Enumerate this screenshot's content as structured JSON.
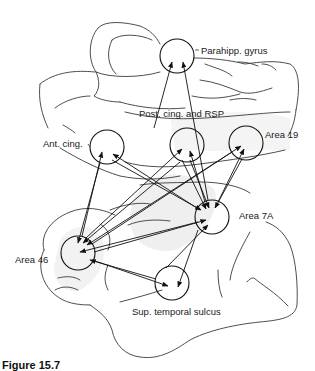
{
  "figure": {
    "type": "brain connectivity diagram",
    "colors": {
      "line": "#111111",
      "outline": "#3a3a3a",
      "shade": "#efefef",
      "background": "#ffffff"
    }
  },
  "nodes": [
    {
      "id": "parahipp",
      "label": "Parahipp. gyrus",
      "cx": 177,
      "cy": 56,
      "r": 17
    },
    {
      "id": "post_cing",
      "label": "Post. cing. and RSP",
      "cx": 187,
      "cy": 145,
      "r": 17
    },
    {
      "id": "ant_cing",
      "label": "Ant. cing.",
      "cx": 107,
      "cy": 147,
      "r": 17
    },
    {
      "id": "area19",
      "label": "Area 19",
      "cx": 246,
      "cy": 143,
      "r": 17
    },
    {
      "id": "area7a",
      "label": "Area 7A",
      "cx": 212,
      "cy": 217,
      "r": 17
    },
    {
      "id": "area46",
      "label": "Area 46",
      "cx": 78,
      "cy": 253,
      "r": 17
    },
    {
      "id": "sts",
      "label": "Sup. temporal sulcus",
      "cx": 172,
      "cy": 283,
      "r": 17
    }
  ],
  "labels": {
    "parahipp": "Parahipp. gyrus",
    "post_cing": "Post. cing. and RSP",
    "ant_cing": "Ant. cing.",
    "area19": "Area 19",
    "area7a": "Area 7A",
    "area46": "Area 46",
    "sts": "Sup. temporal sulcus"
  },
  "caption": {
    "figure_number": "Figure 15.7",
    "text": "(caption truncated at image edge)"
  }
}
